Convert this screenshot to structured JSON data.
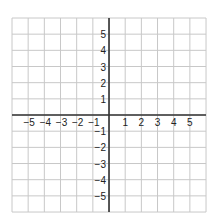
{
  "chart_data": {
    "type": "coordinate-grid",
    "title": "",
    "xlabel": "",
    "ylabel": "",
    "xlim": [
      -6,
      6
    ],
    "ylim": [
      -6,
      6
    ],
    "grid": true,
    "x_tick_labels": [
      "-5",
      "-4",
      "-3",
      "-2",
      "-1",
      "1",
      "2",
      "3",
      "4",
      "5"
    ],
    "y_tick_labels": [
      "5",
      "4",
      "3",
      "2",
      "1",
      "-1",
      "-2",
      "-3",
      "-4",
      "-5"
    ],
    "x_ticks": [
      -5,
      -4,
      -3,
      -2,
      -1,
      1,
      2,
      3,
      4,
      5
    ],
    "y_ticks": [
      5,
      4,
      3,
      2,
      1,
      -1,
      -2,
      -3,
      -4,
      -5
    ],
    "series": []
  },
  "colors": {
    "grid": "#c8c8c8",
    "axis": "#333333",
    "label": "#222222",
    "background": "#ffffff"
  },
  "layout": {
    "left": 12,
    "top": 18,
    "cell": 16.17,
    "cols": 12,
    "rows": 12,
    "origin_col": 6,
    "origin_row": 6
  }
}
